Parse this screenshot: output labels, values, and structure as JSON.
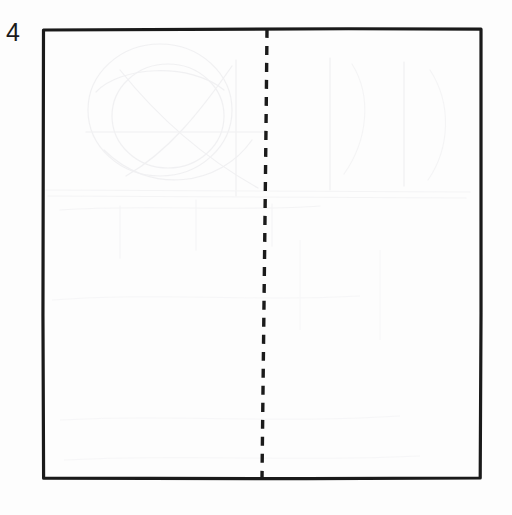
{
  "figure": {
    "label": "4",
    "caption": ""
  },
  "colors": {
    "ink": "#1a1a1a",
    "paper": "#fdfdfd",
    "ghost": "#e9e9ec"
  },
  "diagram_data": {
    "type": "geometry-figure",
    "shapes": [
      {
        "name": "square",
        "kind": "rectangle",
        "stroke": "solid",
        "stroke_width": 3.2,
        "corners": [
          {
            "x": 43,
            "y": 29
          },
          {
            "x": 481,
            "y": 29
          },
          {
            "x": 480,
            "y": 478
          },
          {
            "x": 43,
            "y": 478
          }
        ],
        "width_px": 438,
        "height_px": 449
      },
      {
        "name": "line-of-symmetry",
        "kind": "line",
        "stroke": "dashed",
        "stroke_width": 3.4,
        "dash_length": 9,
        "dash_gap": 8,
        "from": {
          "x": 267,
          "y": 29
        },
        "to": {
          "x": 262,
          "y": 479
        },
        "orientation": "vertical"
      }
    ],
    "annotations": [
      {
        "name": "figure-number",
        "text": "4",
        "x": 8,
        "y": 25
      }
    ]
  }
}
